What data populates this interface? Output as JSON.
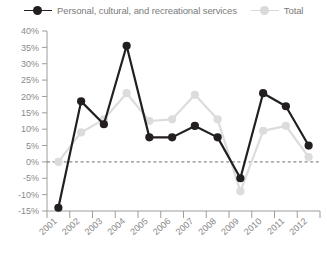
{
  "legend": {
    "entries": [
      {
        "label": "Personal, cultural, and recreational services",
        "color": "#231f20",
        "marker": "dark-circle-marker"
      },
      {
        "label": "Total",
        "color": "#dcdcdc",
        "marker": "light-circle-marker"
      }
    ]
  },
  "chart_data": {
    "type": "line",
    "title": "",
    "xlabel": "",
    "ylabel": "",
    "categories": [
      "2001",
      "2002",
      "2003",
      "2004",
      "2005",
      "2006",
      "2007",
      "2008",
      "2009",
      "2010",
      "2011",
      "2012"
    ],
    "ytick_labels": [
      "40%",
      "35%",
      "30%",
      "25%",
      "20%",
      "15%",
      "10%",
      "5%",
      "0%",
      "-5%",
      "-10%",
      "-15%"
    ],
    "ytick_values": [
      40,
      35,
      30,
      25,
      20,
      15,
      10,
      5,
      0,
      -5,
      -10,
      -15
    ],
    "ylim": [
      -15,
      40
    ],
    "grid": false,
    "legend_position": "top",
    "zero_reference_line": 0,
    "series": [
      {
        "name": "Personal, cultural, and recreational services",
        "color": "#231f20",
        "values": [
          -14.0,
          18.5,
          11.5,
          35.5,
          7.5,
          7.5,
          11.0,
          7.5,
          -5.0,
          21.0,
          17.0,
          5.0
        ]
      },
      {
        "name": "Total",
        "color": "#dcdcdc",
        "values": [
          0.0,
          9.0,
          13.0,
          21.0,
          12.5,
          13.0,
          20.5,
          13.0,
          -9.0,
          9.5,
          11.0,
          1.5
        ]
      }
    ]
  }
}
